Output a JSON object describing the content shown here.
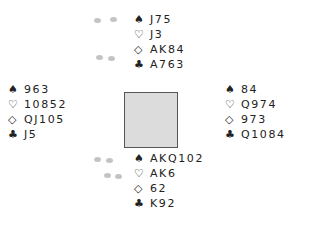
{
  "diagram": {
    "type": "bridge-deal",
    "table_color": "#dcdcdc",
    "table_border": "#555555",
    "hands": {
      "north": [
        {
          "suit": "spades",
          "symbol": "♠",
          "cards": "J75"
        },
        {
          "suit": "hearts",
          "symbol": "♡",
          "cards": "J3"
        },
        {
          "suit": "diamonds",
          "symbol": "◇",
          "cards": "AK84"
        },
        {
          "suit": "clubs",
          "symbol": "♣",
          "cards": "A763"
        }
      ],
      "west": [
        {
          "suit": "spades",
          "symbol": "♠",
          "cards": "963"
        },
        {
          "suit": "hearts",
          "symbol": "♡",
          "cards": "10852"
        },
        {
          "suit": "diamonds",
          "symbol": "◇",
          "cards": "QJ105"
        },
        {
          "suit": "clubs",
          "symbol": "♣",
          "cards": "J5"
        }
      ],
      "east": [
        {
          "suit": "spades",
          "symbol": "♠",
          "cards": "84"
        },
        {
          "suit": "hearts",
          "symbol": "♡",
          "cards": "Q974"
        },
        {
          "suit": "diamonds",
          "symbol": "◇",
          "cards": "973"
        },
        {
          "suit": "clubs",
          "symbol": "♣",
          "cards": "Q1084"
        }
      ],
      "south": [
        {
          "suit": "spades",
          "symbol": "♠",
          "cards": "AKQ102"
        },
        {
          "suit": "hearts",
          "symbol": "♡",
          "cards": "AK6"
        },
        {
          "suit": "diamonds",
          "symbol": "◇",
          "cards": "62"
        },
        {
          "suit": "clubs",
          "symbol": "♣",
          "cards": "K92"
        }
      ]
    }
  }
}
